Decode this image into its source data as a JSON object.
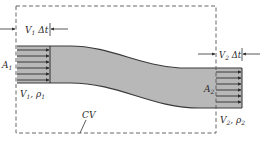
{
  "diagram": {
    "type": "control-volume-flow",
    "labels": {
      "inlet_displacement": {
        "base": "V",
        "sub": "1",
        "rest": " Δt"
      },
      "outlet_displacement": {
        "base": "V",
        "sub": "2",
        "rest": " Δt"
      },
      "inlet_area": {
        "base": "A",
        "sub": "1"
      },
      "outlet_area": {
        "base": "A",
        "sub": "2"
      },
      "inlet_props": {
        "base1": "V",
        "sub1": "1",
        "sep": ", ",
        "base2": "ρ",
        "sub2": "1"
      },
      "outlet_props": {
        "base1": "V",
        "sub1": "2",
        "sep": ", ",
        "base2": "ρ",
        "sub2": "2"
      },
      "control_volume": "CV"
    },
    "colors": {
      "fluid_fill": "#b8b8b8",
      "outline": "#3a3a3a",
      "dashed_boundary": "#555555",
      "arrows": "#2e2e2e"
    }
  }
}
